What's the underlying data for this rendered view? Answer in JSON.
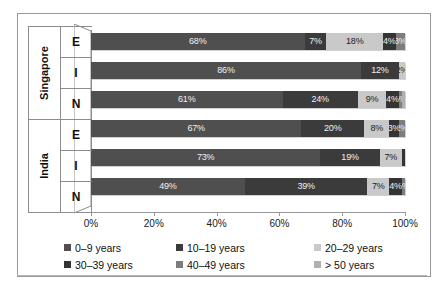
{
  "chart_data": {
    "type": "bar",
    "orientation": "horizontal",
    "stacked": true,
    "percent_stacked": true,
    "title": "",
    "subtitle": "",
    "xlabel": "",
    "ylabel": "",
    "xlim": [
      0,
      100
    ],
    "xticks": [
      "0%",
      "20%",
      "40%",
      "60%",
      "80%",
      "100%"
    ],
    "xtick_values": [
      0,
      20,
      40,
      60,
      80,
      100
    ],
    "grid": false,
    "legend_position": "bottom",
    "group_labels": [
      "Singapore",
      "India"
    ],
    "categories": [
      "E",
      "I",
      "N",
      "E",
      "I",
      "N"
    ],
    "series": [
      {
        "name": "0–9 years",
        "color": "#4f4f4f",
        "values": [
          68,
          86,
          61,
          67,
          73,
          49
        ]
      },
      {
        "name": "10–19 years",
        "color": "#3b3b3b",
        "values": [
          7,
          12,
          24,
          20,
          19,
          39
        ]
      },
      {
        "name": "20–29 years",
        "color": "#c9c9c9",
        "values": [
          18,
          2,
          9,
          8,
          7,
          7
        ]
      },
      {
        "name": "30–39 years",
        "color": "#343434",
        "values": [
          4,
          0,
          4,
          3,
          1,
          4
        ]
      },
      {
        "name": "40–49 years",
        "color": "#7d7d7d",
        "values": [
          3,
          0,
          1,
          2,
          0,
          1
        ]
      },
      {
        "name": "> 50 years",
        "color": "#b0b0b0",
        "values": [
          0,
          0,
          1,
          0,
          0,
          0
        ]
      }
    ],
    "bars": [
      {
        "group": "Singapore",
        "category": "E",
        "segments": [
          {
            "series": "0–9 years",
            "value": 68,
            "label": "68%",
            "show_label": true
          },
          {
            "series": "10–19 years",
            "value": 7,
            "label": "7%",
            "show_label": true
          },
          {
            "series": "20–29 years",
            "value": 18,
            "label": "18%",
            "show_label": true
          },
          {
            "series": "30–39 years",
            "value": 4,
            "label": "4%",
            "show_label": true
          },
          {
            "series": "40–49 years",
            "value": 3,
            "label": "3%",
            "show_label": true
          },
          {
            "series": "> 50 years",
            "value": 0,
            "label": "",
            "show_label": false
          }
        ]
      },
      {
        "group": "Singapore",
        "category": "I",
        "segments": [
          {
            "series": "0–9 years",
            "value": 86,
            "label": "86%",
            "show_label": true
          },
          {
            "series": "10–19 years",
            "value": 12,
            "label": "12%",
            "show_label": true
          },
          {
            "series": "20–29 years",
            "value": 2,
            "label": "2%",
            "show_label": true
          },
          {
            "series": "30–39 years",
            "value": 0,
            "label": "",
            "show_label": false
          },
          {
            "series": "40–49 years",
            "value": 0,
            "label": "",
            "show_label": false
          },
          {
            "series": "> 50 years",
            "value": 0,
            "label": "",
            "show_label": false
          }
        ]
      },
      {
        "group": "Singapore",
        "category": "N",
        "segments": [
          {
            "series": "0–9 years",
            "value": 61,
            "label": "61%",
            "show_label": true
          },
          {
            "series": "10–19 years",
            "value": 24,
            "label": "24%",
            "show_label": true
          },
          {
            "series": "20–29 years",
            "value": 9,
            "label": "9%",
            "show_label": true
          },
          {
            "series": "30–39 years",
            "value": 4,
            "label": "4%",
            "show_label": true
          },
          {
            "series": "40–49 years",
            "value": 1,
            "label": "1%",
            "show_label": true
          },
          {
            "series": "> 50 years",
            "value": 1,
            "label": "",
            "show_label": false
          }
        ]
      },
      {
        "group": "India",
        "category": "E",
        "segments": [
          {
            "series": "0–9 years",
            "value": 67,
            "label": "67%",
            "show_label": true
          },
          {
            "series": "10–19 years",
            "value": 20,
            "label": "20%",
            "show_label": true
          },
          {
            "series": "20–29 years",
            "value": 8,
            "label": "8%",
            "show_label": true
          },
          {
            "series": "30–39 years",
            "value": 3,
            "label": "3%",
            "show_label": true
          },
          {
            "series": "40–49 years",
            "value": 2,
            "label": "2%",
            "show_label": true
          },
          {
            "series": "> 50 years",
            "value": 0,
            "label": "",
            "show_label": false
          }
        ]
      },
      {
        "group": "India",
        "category": "I",
        "segments": [
          {
            "series": "0–9 years",
            "value": 73,
            "label": "73%",
            "show_label": true
          },
          {
            "series": "10–19 years",
            "value": 19,
            "label": "19%",
            "show_label": true
          },
          {
            "series": "20–29 years",
            "value": 7,
            "label": "7%",
            "show_label": true
          },
          {
            "series": "30–39 years",
            "value": 1,
            "label": "",
            "show_label": false
          },
          {
            "series": "40–49 years",
            "value": 0,
            "label": "",
            "show_label": false
          },
          {
            "series": "> 50 years",
            "value": 0,
            "label": "",
            "show_label": false
          }
        ]
      },
      {
        "group": "India",
        "category": "N",
        "segments": [
          {
            "series": "0–9 years",
            "value": 49,
            "label": "49%",
            "show_label": true
          },
          {
            "series": "10–19 years",
            "value": 39,
            "label": "39%",
            "show_label": true
          },
          {
            "series": "20–29 years",
            "value": 7,
            "label": "7%",
            "show_label": true
          },
          {
            "series": "30–39 years",
            "value": 4,
            "label": "4%",
            "show_label": true
          },
          {
            "series": "40–49 years",
            "value": 1,
            "label": "1%",
            "show_label": true
          },
          {
            "series": "> 50 years",
            "value": 0,
            "label": "",
            "show_label": false
          }
        ]
      }
    ],
    "legend": [
      {
        "label": "0–9 years",
        "color": "#4f4f4f"
      },
      {
        "label": "10–19 years",
        "color": "#3b3b3b"
      },
      {
        "label": "20–29 years",
        "color": "#c9c9c9"
      },
      {
        "label": "30–39 years",
        "color": "#343434"
      },
      {
        "label": "40–49 years",
        "color": "#7d7d7d"
      },
      {
        "label": "> 50 years",
        "color": "#b0b0b0"
      }
    ]
  }
}
